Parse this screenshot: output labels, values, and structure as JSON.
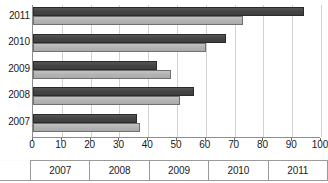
{
  "chart_data": {
    "type": "bar",
    "orientation": "horizontal",
    "title": "",
    "xlabel": "",
    "ylabel": "",
    "categories": [
      "2007",
      "2008",
      "2009",
      "2010",
      "2011"
    ],
    "series": [
      {
        "name": "series-1-dark",
        "color": "#4b4b4b",
        "values": [
          36,
          56,
          43,
          67,
          94
        ]
      },
      {
        "name": "series-2-light",
        "color": "#b5b5b5",
        "values": [
          37,
          51,
          48,
          60,
          73
        ]
      }
    ],
    "xlim": [
      0,
      100
    ],
    "xticks": [
      0,
      10,
      20,
      30,
      40,
      50,
      60,
      70,
      80,
      90,
      100
    ],
    "xtick_labels": [
      "0",
      "10",
      "20",
      "30",
      "40",
      "50",
      "60",
      "70",
      "80",
      "90",
      "100"
    ],
    "grid": "vertical",
    "legend": "none"
  },
  "axis": {
    "y_categories": [
      "2011",
      "2010",
      "2009",
      "2008",
      "2007"
    ]
  },
  "table": {
    "stub_label": "",
    "columns": [
      "2007",
      "2008",
      "2009",
      "2010",
      "2011"
    ]
  },
  "colors": {
    "series_dark": "#4b4b4b",
    "series_light": "#b5b5b5",
    "gridline": "#d2d2d2",
    "axis": "#8d8d8d",
    "text": "#1a1a1a",
    "background": "#ffffff"
  }
}
